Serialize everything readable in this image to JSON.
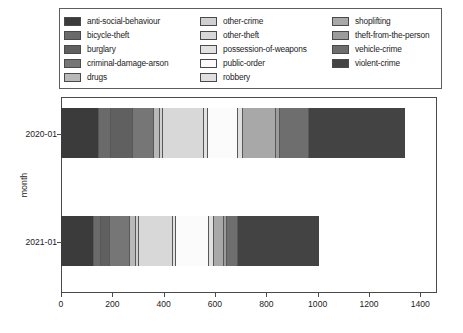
{
  "chart_data": {
    "type": "bar",
    "orientation": "horizontal",
    "stacked": true,
    "title": "",
    "xlabel": "",
    "ylabel": "month",
    "categories": [
      "2020-01",
      "2021-01"
    ],
    "xlim": [
      0,
      1465
    ],
    "xticks": [
      0,
      200,
      400,
      600,
      800,
      1000,
      1200,
      1400
    ],
    "grid": false,
    "legend_position": "above-plot",
    "series": [
      {
        "name": "anti-social-behaviour",
        "color": "#3b3b3b",
        "values": [
          148,
          130
        ]
      },
      {
        "name": "bicycle-theft",
        "color": "#6a6a6a",
        "values": [
          48,
          25
        ]
      },
      {
        "name": "burglary",
        "color": "#606060",
        "values": [
          85,
          35
        ]
      },
      {
        "name": "criminal-damage-arson",
        "color": "#767676",
        "values": [
          82,
          80
        ]
      },
      {
        "name": "drugs",
        "color": "#b9b9b9",
        "values": [
          22,
          22
        ]
      },
      {
        "name": "other-crime",
        "color": "#d0d0d0",
        "values": [
          14,
          14
        ]
      },
      {
        "name": "other-theft",
        "color": "#d8d8d8",
        "values": [
          160,
          130
        ]
      },
      {
        "name": "possession-of-weapons",
        "color": "#e2e2e2",
        "values": [
          12,
          12
        ]
      },
      {
        "name": "public-order",
        "color": "#fbfbfb",
        "values": [
          118,
          130
        ]
      },
      {
        "name": "robbery",
        "color": "#e0e0e0",
        "values": [
          22,
          18
        ]
      },
      {
        "name": "shoplifting",
        "color": "#a8a8a8",
        "values": [
          126,
          38
        ]
      },
      {
        "name": "theft-from-the-person",
        "color": "#9c9c9c",
        "values": [
          16,
          12
        ]
      },
      {
        "name": "vehicle-crime",
        "color": "#6e6e6e",
        "values": [
          112,
          44
        ]
      },
      {
        "name": "violent-crime",
        "color": "#434343",
        "values": [
          375,
          315
        ]
      }
    ],
    "totals": [
      1340,
      1005
    ]
  },
  "legend": {
    "columns": [
      [
        {
          "label": "anti-social-behaviour",
          "color": "#3b3b3b"
        },
        {
          "label": "bicycle-theft",
          "color": "#6a6a6a"
        },
        {
          "label": "burglary",
          "color": "#606060"
        },
        {
          "label": "criminal-damage-arson",
          "color": "#767676"
        },
        {
          "label": "drugs",
          "color": "#b9b9b9"
        }
      ],
      [
        {
          "label": "other-crime",
          "color": "#d0d0d0"
        },
        {
          "label": "other-theft",
          "color": "#d8d8d8"
        },
        {
          "label": "possession-of-weapons",
          "color": "#e2e2e2"
        },
        {
          "label": "public-order",
          "color": "#fbfbfb"
        },
        {
          "label": "robbery",
          "color": "#e0e0e0"
        }
      ],
      [
        {
          "label": "shoplifting",
          "color": "#a8a8a8"
        },
        {
          "label": "theft-from-the-person",
          "color": "#9c9c9c"
        },
        {
          "label": "vehicle-crime",
          "color": "#6e6e6e"
        },
        {
          "label": "violent-crime",
          "color": "#434343"
        }
      ]
    ]
  },
  "axes": {
    "y_label": "month",
    "y_ticks": [
      "2020-01",
      "2021-01"
    ],
    "x_ticks": [
      "0",
      "200",
      "400",
      "600",
      "800",
      "1000",
      "1200",
      "1400"
    ]
  }
}
